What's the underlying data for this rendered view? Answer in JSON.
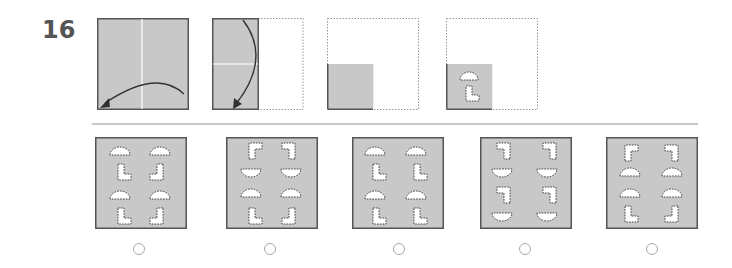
{
  "question": {
    "number": "16",
    "colors": {
      "paper_fill": "#c8c8c8",
      "paper_border": "#555555",
      "fold_line": "#ffffff",
      "outline_dotted": "#999999",
      "cut_hole": "#ffffff",
      "arrow": "#333333",
      "radio_border": "#a8a8a8"
    },
    "steps": [
      {
        "name": "full-square",
        "fold": "vertical-center",
        "arrow": "right-to-left"
      },
      {
        "name": "half-folded",
        "fold": "horizontal-center",
        "arrow": "top-to-bottom"
      },
      {
        "name": "quarter-folded"
      },
      {
        "name": "quarter-with-cuts",
        "cuts": [
          "semicircle-top",
          "L-shape"
        ]
      }
    ],
    "options": [
      {
        "id": "A",
        "selected": false
      },
      {
        "id": "B",
        "selected": false
      },
      {
        "id": "C",
        "selected": false
      },
      {
        "id": "D",
        "selected": false
      },
      {
        "id": "E",
        "selected": false
      }
    ]
  }
}
